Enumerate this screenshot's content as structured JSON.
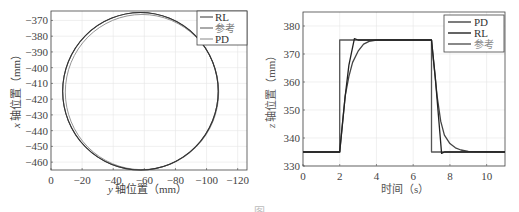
{
  "chart_data": [
    {
      "type": "line",
      "title": "",
      "xlabel_var": "y",
      "xlabel": "轴位置（mm）",
      "ylabel_var": "x",
      "ylabel": "轴位置（mm）",
      "xlim": [
        0,
        -126
      ],
      "ylim": [
        -465,
        -364
      ],
      "x_reversed": true,
      "xticks": [
        0,
        -20,
        -40,
        -60,
        -80,
        -100,
        -120
      ],
      "xtick_labels": [
        "0",
        "−20",
        "−40",
        "−60",
        "−80",
        "−100",
        "−120"
      ],
      "yticks": [
        -370,
        -380,
        -390,
        -400,
        -410,
        -420,
        -430,
        -440,
        -450,
        -460
      ],
      "ytick_labels": [
        "−370",
        "−380",
        "−390",
        "−400",
        "−410",
        "−420",
        "−430",
        "−440",
        "−450",
        "−460"
      ],
      "grid": true,
      "legend_position": "upper right",
      "series": [
        {
          "name": "RL",
          "color": "#333333",
          "shape": "circle",
          "center": [
            -57.5,
            -415
          ],
          "radius": 50
        },
        {
          "name": "参考",
          "color": "#555555",
          "shape": "circle",
          "center": [
            -57.5,
            -415
          ],
          "radius": 50
        },
        {
          "name": "PD",
          "color": "#888888",
          "shape": "circle",
          "center": [
            -58.5,
            -415.5
          ],
          "radius": 49.3
        }
      ]
    },
    {
      "type": "line",
      "title": "",
      "xlabel": "时间（s）",
      "ylabel_var": "z",
      "ylabel": "轴位置（mm）",
      "xlim": [
        0,
        11
      ],
      "ylim": [
        330,
        385
      ],
      "xticks": [
        0,
        2,
        4,
        6,
        8,
        10
      ],
      "xtick_labels": [
        "0",
        "2",
        "4",
        "6",
        "8",
        "10"
      ],
      "yticks": [
        330,
        340,
        350,
        360,
        370,
        380
      ],
      "ytick_labels": [
        "330",
        "340",
        "350",
        "360",
        "370",
        "380"
      ],
      "grid": true,
      "legend_position": "upper right",
      "series": [
        {
          "name": "PD",
          "color": "#444444",
          "x": [
            0,
            2,
            2.1,
            2.3,
            2.5,
            2.7,
            3.0,
            3.3,
            3.6,
            4.0,
            7.0,
            7.1,
            7.3,
            7.5,
            7.7,
            8.0,
            8.3,
            8.6,
            9.0,
            11
          ],
          "y": [
            335,
            335,
            342,
            355,
            362,
            367,
            371,
            373.5,
            374.5,
            375,
            375,
            368,
            355,
            346,
            341,
            338,
            336.5,
            335.7,
            335.2,
            335
          ]
        },
        {
          "name": "RL",
          "color": "#222222",
          "x": [
            0,
            2,
            2.3,
            2.5,
            2.8,
            3.0,
            7.0,
            7.2,
            7.4,
            7.55,
            7.7,
            11
          ],
          "y": [
            335,
            335,
            355,
            366,
            375.5,
            375,
            375,
            362,
            346,
            334.5,
            335,
            335
          ]
        },
        {
          "name": "参考",
          "color": "#555555",
          "x": [
            0,
            2,
            2,
            7,
            7,
            11
          ],
          "y": [
            335,
            335,
            375,
            375,
            335,
            335
          ]
        }
      ]
    }
  ],
  "left_chart": {
    "ylabel_var": "x",
    "ylabel": "轴位置（mm）",
    "xlabel_var": "y",
    "xlabel": "轴位置（mm）",
    "legend": [
      "RL",
      "参考",
      "PD"
    ]
  },
  "right_chart": {
    "ylabel_var": "z",
    "ylabel": "轴位置（mm）",
    "xlabel": "时间（s）",
    "legend": [
      "PD",
      "RL",
      "参考"
    ]
  },
  "caption": "图"
}
